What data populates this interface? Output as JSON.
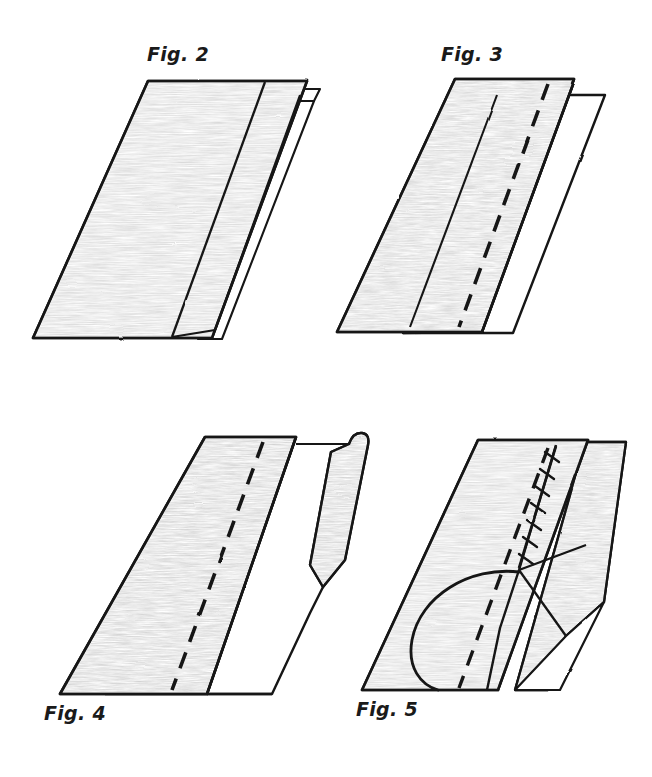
{
  "document": {
    "kind": "hand-drawn sewing / fabric folding instruction plate",
    "background_color": "#ffffff",
    "ink_color": "#141414",
    "shading_color": "#c9c9c9",
    "width": 652,
    "height": 777
  },
  "figures": [
    {
      "id": "fig2",
      "caption": "Fig. 2",
      "caption_position": "above",
      "description": "Flat shaded fabric panel seen in perspective with one vertical fold line near the right and a thin white under-layer peeking out behind the right edge.",
      "elements": [
        "shaded-panel",
        "fold-line",
        "under-layer-flap"
      ]
    },
    {
      "id": "fig3",
      "caption": "Fig. 3",
      "caption_position": "above",
      "description": "Same panel with the right portion turned back showing an unshaded white facing; a bold dashed stitch guide line runs down the shaded panel parallel to the fold.",
      "elements": [
        "shaded-panel",
        "white-facing-panel",
        "dashed-stitch-line",
        "fold-edge"
      ]
    },
    {
      "id": "fig4",
      "caption": "Fig. 4",
      "caption_position": "below",
      "description": "The folded edge is lifted up into a standing flap with a rounded top corner and a V notch where the flap leaves the flat panel; dashed stitch line still visible on the shaded panel.",
      "elements": [
        "shaded-panel",
        "dashed-stitch-line",
        "white-panel",
        "lifted-flap",
        "v-notch"
      ]
    },
    {
      "id": "fig5",
      "caption": "Fig. 5",
      "caption_position": "below",
      "description": "Completed seam: a stitched line with slanted hand-stitch tick marks runs down the fold, narrow folded strips lie along the right edge, and a curved arrow indicates the direction the flap is rotated over.",
      "elements": [
        "shaded-panel",
        "dashed-stitch-line",
        "stitch-ticks",
        "folded-strips",
        "rotation-arrow"
      ]
    }
  ],
  "legend": {
    "dashed_line_meaning": "stitching guide line",
    "tick_marks_meaning": "hand stitches",
    "curved_arrow_meaning": "fold / rotate direction"
  }
}
